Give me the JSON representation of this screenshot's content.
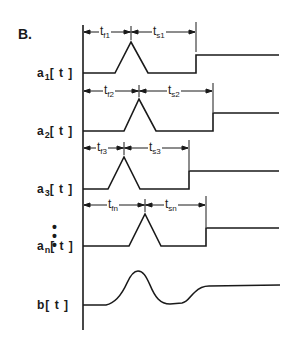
{
  "panel_label": "B.",
  "signals": [
    {
      "name": "a",
      "sub": "1",
      "arg": "[ t ]",
      "tf": {
        "base": "t",
        "sub": "f1"
      },
      "ts": {
        "base": "t",
        "sub": "s1"
      }
    },
    {
      "name": "a",
      "sub": "2",
      "arg": "[ t ]",
      "tf": {
        "base": "t",
        "sub": "f2"
      },
      "ts": {
        "base": "t",
        "sub": "s2"
      }
    },
    {
      "name": "a",
      "sub": "3",
      "arg": "[ t ]",
      "tf": {
        "base": "t",
        "sub": "f3"
      },
      "ts": {
        "base": "t",
        "sub": "s3"
      }
    },
    {
      "name": "a",
      "sub": "n",
      "arg": "[ t ]",
      "tf": {
        "base": "t",
        "sub": "fn"
      },
      "ts": {
        "base": "t",
        "sub": "sn"
      }
    }
  ],
  "ellipsis": "•\n•\n•",
  "output": {
    "name": "b",
    "arg": "[ t ]"
  },
  "colors": {
    "ink": "#1a1a1a",
    "background": "#ffffff"
  }
}
